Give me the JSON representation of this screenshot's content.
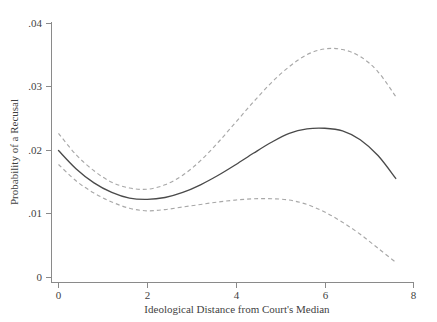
{
  "chart_data": {
    "type": "line",
    "title": "",
    "subtitle": "",
    "xlabel": "Ideological Distance from Court's Median",
    "ylabel": "Probability of a Recusal",
    "xlim": [
      0,
      8
    ],
    "ylim": [
      0,
      0.04
    ],
    "xticks": [
      0,
      2,
      4,
      6,
      8
    ],
    "xtick_labels": [
      "0",
      "2",
      "4",
      "6",
      "8"
    ],
    "yticks": [
      0,
      0.01,
      0.02,
      0.03,
      0.04
    ],
    "ytick_labels": [
      "0",
      ".01",
      ".02",
      ".03",
      ".04"
    ],
    "grid": false,
    "legend": "none",
    "annotations": [],
    "x": [
      0.0,
      0.4,
      0.8,
      1.2,
      1.6,
      2.0,
      2.4,
      2.8,
      3.2,
      3.6,
      4.0,
      4.4,
      4.8,
      5.2,
      5.6,
      6.0,
      6.4,
      6.8,
      7.2,
      7.6
    ],
    "series": [
      {
        "name": "Predicted probability",
        "style": "solid",
        "color": "#4a4a4a",
        "values": [
          0.02,
          0.0171,
          0.0149,
          0.0134,
          0.0125,
          0.0123,
          0.0126,
          0.0134,
          0.0146,
          0.0161,
          0.0178,
          0.0196,
          0.0213,
          0.0227,
          0.0234,
          0.0235,
          0.0231,
          0.0217,
          0.0192,
          0.0156
        ]
      },
      {
        "name": "Upper 95% confidence bound",
        "style": "dashed",
        "color": "#a8a8a8",
        "values": [
          0.0227,
          0.0193,
          0.0168,
          0.015,
          0.0141,
          0.0139,
          0.0146,
          0.0161,
          0.0184,
          0.0213,
          0.0245,
          0.0277,
          0.0307,
          0.0332,
          0.0351,
          0.036,
          0.0359,
          0.0348,
          0.0324,
          0.0285
        ]
      },
      {
        "name": "Lower 95% confidence bound",
        "style": "dashed",
        "color": "#a8a8a8",
        "values": [
          0.0178,
          0.0152,
          0.0133,
          0.0119,
          0.0109,
          0.0105,
          0.0107,
          0.0111,
          0.0115,
          0.0119,
          0.0122,
          0.0124,
          0.0124,
          0.0122,
          0.0115,
          0.0103,
          0.0087,
          0.0068,
          0.0046,
          0.0024
        ]
      }
    ]
  },
  "axes": {
    "x_title": "Ideological Distance from Court's Median",
    "y_title": "Probability of a Recusal",
    "x_ticks": [
      {
        "label": "0",
        "value": 0
      },
      {
        "label": "2",
        "value": 2
      },
      {
        "label": "4",
        "value": 4
      },
      {
        "label": "6",
        "value": 6
      },
      {
        "label": "8",
        "value": 8
      }
    ],
    "y_ticks": [
      {
        "label": ".04",
        "value": 0.04
      },
      {
        "label": ".03",
        "value": 0.03
      },
      {
        "label": ".02",
        "value": 0.02
      },
      {
        "label": ".01",
        "value": 0.01
      },
      {
        "label": "0",
        "value": 0
      }
    ]
  },
  "colors": {
    "background": "#ffffff",
    "axis": "#8a8a8a",
    "fit_line": "#4a4a4a",
    "ci_line": "#a8a8a8",
    "text": "#3f3f3f"
  }
}
